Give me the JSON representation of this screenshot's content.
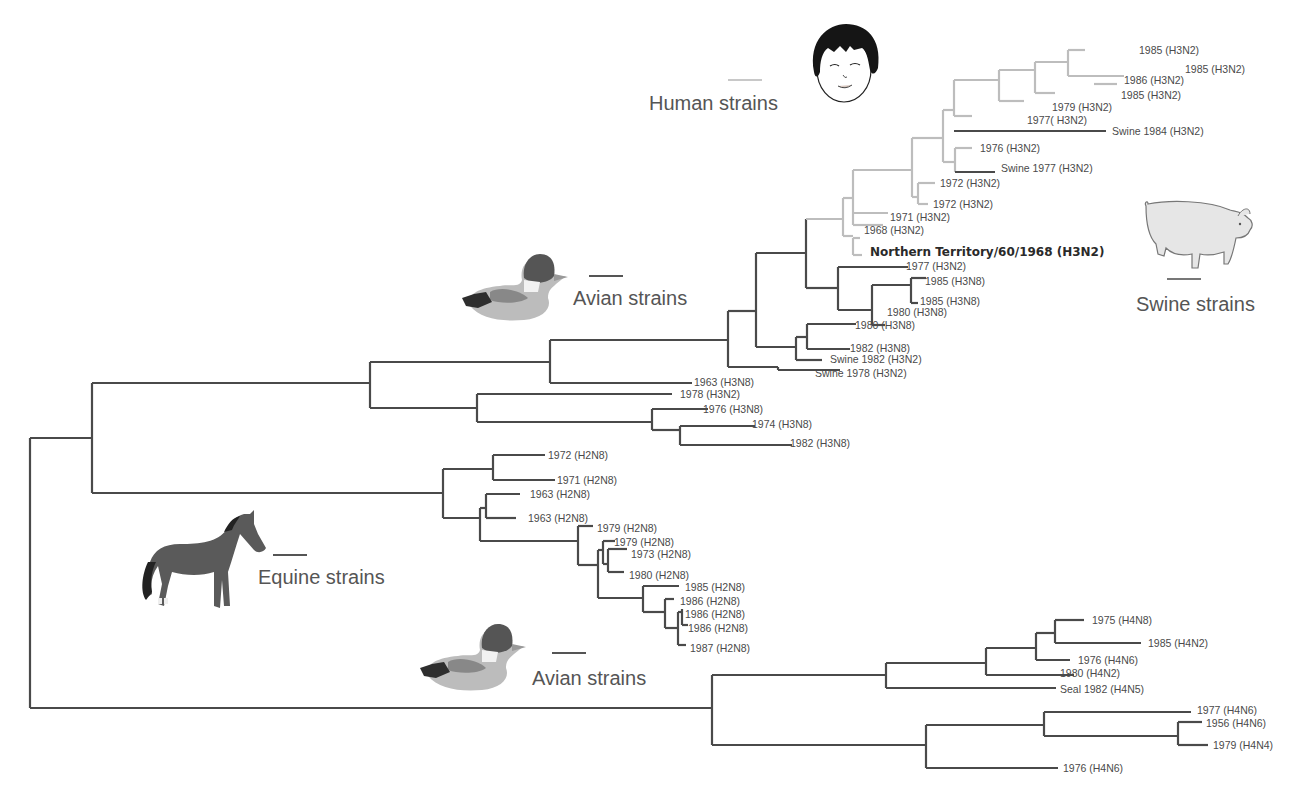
{
  "figure": {
    "type": "phylogenetic-tree",
    "colors": {
      "human_branch": "#bdbdbd",
      "other_branch": "#4a4a4a",
      "text": "#4a4a4a"
    }
  },
  "legend": {
    "human": {
      "label": "Human strains",
      "color": "#bdbdbd",
      "icon": "human-face-icon"
    },
    "swine": {
      "label": "Swine strains",
      "color": "#777777",
      "icon": "pig-icon"
    },
    "avian_upper": {
      "label": "Avian strains",
      "color": "#555555",
      "icon": "duck-icon"
    },
    "equine": {
      "label": "Equine strains",
      "color": "#555555",
      "icon": "horse-icon"
    },
    "avian_lower": {
      "label": "Avian strains",
      "color": "#555555",
      "icon": "duck-icon"
    }
  },
  "leaves": [
    "1985 (H3N2)",
    "1985 (H3N2)",
    "1986 (H3N2)",
    "1985 (H3N2)",
    "1979 (H3N2)",
    "1977( H3N2)",
    "Swine 1984 (H3N2)",
    "1976 (H3N2)",
    "Swine 1977 (H3N2)",
    "1972 (H3N2)",
    "1972 (H3N2)",
    "1971 (H3N2)",
    "1968 (H3N2)",
    "Northern Territory/60/1968 (H3N2)",
    "1977 (H3N2)",
    "1985 (H3N8)",
    "1985 (H3N8)",
    "1980 (H3N8)",
    "1980 (H3N8)",
    "1982 (H3N8)",
    "Swine 1982 (H3N2)",
    "Swine 1978 (H3N2)",
    "1963 (H3N8)",
    "1978 (H3N2)",
    "1976 (H3N8)",
    "1974 (H3N8)",
    "1982 (H3N8)",
    "1972 (H2N8)",
    "1971 (H2N8)",
    "1963 (H2N8)",
    "1963 (H2N8)",
    "1979 (H2N8)",
    "1979 (H2N8)",
    "1973 (H2N8)",
    "1980 (H2N8)",
    "1985 (H2N8)",
    "1986 (H2N8)",
    "1986 (H2N8)",
    "1986 (H2N8)",
    "1987 (H2N8)",
    "1975 (H4N8)",
    "1985 (H4N2)",
    "1976 (H4N6)",
    "1980 (H4N2)",
    "Seal 1982 (H4N5)",
    "1977 (H4N6)",
    "1956 (H4N6)",
    "1979 (H4N4)",
    "1976 (H4N6)"
  ]
}
